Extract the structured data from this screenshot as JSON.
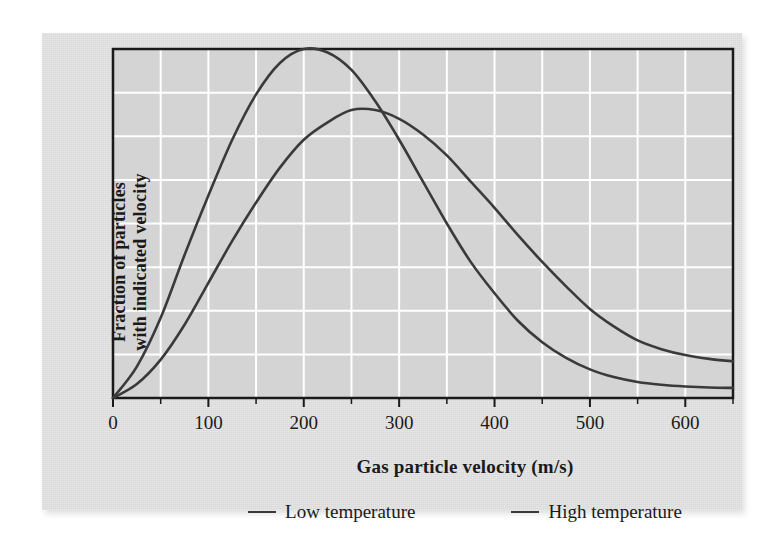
{
  "figure": {
    "panel_bg": "#d9d9d9",
    "plot_bg": "#d4d4d4",
    "grid_color": "#ffffff",
    "frame_color": "#1a1a1a",
    "curve_color": "#3a3a3a"
  },
  "axes": {
    "x_title": "Gas particle velocity (m/s)",
    "y_title_line1": "Fraction of particles",
    "y_title_line2": "with indicated velocity",
    "x_ticks": [
      "0",
      "100",
      "200",
      "300",
      "400",
      "500",
      "600"
    ]
  },
  "legend": {
    "entries": [
      {
        "label": "Low temperature",
        "color": "#3a3a3a"
      },
      {
        "label": "High temperature",
        "color": "#3a3a3a"
      }
    ]
  },
  "chart_data": {
    "type": "line",
    "title": "",
    "xlabel": "Gas particle velocity (m/s)",
    "ylabel": "Fraction of particles with indicated velocity",
    "xlim": [
      0,
      650
    ],
    "ylim": [
      0,
      1.0
    ],
    "xticks": [
      0,
      100,
      200,
      300,
      400,
      500,
      600
    ],
    "yticks": [],
    "grid": true,
    "grid_x_step": 50,
    "grid_y_count": 7,
    "legend_position": "below",
    "x": [
      0,
      25,
      50,
      75,
      100,
      125,
      150,
      175,
      200,
      225,
      250,
      275,
      300,
      325,
      350,
      375,
      400,
      425,
      450,
      475,
      500,
      525,
      550,
      575,
      600,
      625,
      650
    ],
    "series": [
      {
        "name": "Low temperature",
        "color": "#3a3a3a",
        "peak_x": 200,
        "peak_y": 1.0,
        "values": [
          0.0,
          0.09,
          0.23,
          0.41,
          0.58,
          0.74,
          0.87,
          0.96,
          1.0,
          0.99,
          0.94,
          0.85,
          0.74,
          0.62,
          0.5,
          0.39,
          0.3,
          0.22,
          0.16,
          0.115,
          0.082,
          0.06,
          0.046,
          0.038,
          0.033,
          0.03,
          0.029
        ]
      },
      {
        "name": "High temperature",
        "color": "#3a3a3a",
        "peak_x": 250,
        "peak_y": 0.825,
        "values": [
          0.0,
          0.04,
          0.11,
          0.21,
          0.33,
          0.45,
          0.56,
          0.66,
          0.74,
          0.79,
          0.825,
          0.825,
          0.8,
          0.755,
          0.695,
          0.62,
          0.545,
          0.465,
          0.39,
          0.32,
          0.255,
          0.205,
          0.165,
          0.14,
          0.123,
          0.112,
          0.105
        ]
      }
    ]
  }
}
